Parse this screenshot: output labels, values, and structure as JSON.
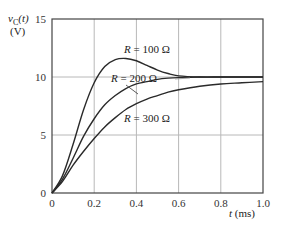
{
  "chart_data": {
    "type": "line",
    "title": "",
    "xlabel": "t (ms)",
    "ylabel": "v_C(t) (V)",
    "xlim": [
      0,
      1.0
    ],
    "ylim": [
      0,
      15
    ],
    "grid": true,
    "x_ticks": [
      "0",
      "0.2",
      "0.4",
      "0.6",
      "0.8",
      "1.0"
    ],
    "y_ticks": [
      "0",
      "5",
      "10",
      "15"
    ],
    "x": [
      0,
      0.05,
      0.1,
      0.15,
      0.2,
      0.25,
      0.3,
      0.35,
      0.4,
      0.45,
      0.5,
      0.55,
      0.6,
      0.7,
      0.8,
      0.9,
      1.0
    ],
    "series": [
      {
        "name": "R = 100 Ω",
        "values": [
          0,
          1.5,
          4.2,
          7.2,
          9.5,
          10.9,
          11.5,
          11.6,
          11.4,
          11.0,
          10.6,
          10.3,
          10.1,
          10.0,
          10.0,
          10.0,
          10.0
        ]
      },
      {
        "name": "R = 200 Ω",
        "values": [
          0,
          1.2,
          3.0,
          4.9,
          6.4,
          7.6,
          8.4,
          9.0,
          9.4,
          9.6,
          9.8,
          9.9,
          9.95,
          10.0,
          10.0,
          10.0,
          10.0
        ]
      },
      {
        "name": "R = 300 Ω",
        "values": [
          0,
          1.0,
          2.4,
          3.6,
          4.7,
          5.7,
          6.5,
          7.2,
          7.7,
          8.1,
          8.4,
          8.7,
          8.9,
          9.2,
          9.4,
          9.5,
          9.6
        ]
      }
    ],
    "annotations": [
      "R = 100 Ω",
      "R = 200 Ω",
      "R = 300 Ω"
    ]
  },
  "labels": {
    "ylabel_line1": "v",
    "ylabel_sub": "C",
    "ylabel_arg": "(t)",
    "ylabel_line2": "(V)",
    "xlabel_var": "t",
    "xlabel_unit": " (ms)",
    "r100": "R = 100 Ω",
    "r200": "R = 200 Ω",
    "r300": "R = 300 Ω"
  }
}
